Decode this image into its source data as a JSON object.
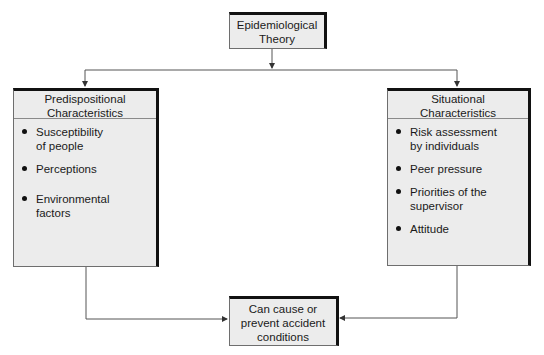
{
  "diagram": {
    "top_node": {
      "label": "Epidemiological Theory",
      "lines": [
        "Epidemiological",
        "Theory"
      ]
    },
    "left_group": {
      "title_lines": [
        "Predispositional",
        "Characteristics"
      ],
      "items": [
        {
          "lines": [
            "Susceptibility",
            "of people"
          ]
        },
        {
          "lines": [
            "Perceptions"
          ]
        },
        {
          "lines": [
            "Environmental",
            "factors"
          ]
        }
      ]
    },
    "right_group": {
      "title_lines": [
        "Situational",
        "Characteristics"
      ],
      "items": [
        {
          "lines": [
            "Risk assessment",
            "by individuals"
          ]
        },
        {
          "lines": [
            "Peer pressure"
          ]
        },
        {
          "lines": [
            "Priorities of the",
            "supervisor"
          ]
        },
        {
          "lines": [
            "Attitude"
          ]
        }
      ]
    },
    "bottom_node": {
      "lines": [
        "Can cause or",
        "prevent accident",
        "conditions"
      ]
    },
    "edges": [
      {
        "from": "Epidemiological Theory",
        "to": "Predispositional Characteristics"
      },
      {
        "from": "Epidemiological Theory",
        "to": "Situational Characteristics"
      },
      {
        "from": "Predispositional Characteristics",
        "to": "Can cause or prevent accident conditions"
      },
      {
        "from": "Situational Characteristics",
        "to": "Can cause or prevent accident conditions"
      }
    ],
    "colors": {
      "box_fill": "#ececec",
      "box_border": "#6e6e6e",
      "box_shadow_border": "#111111",
      "line": "#555555"
    }
  }
}
